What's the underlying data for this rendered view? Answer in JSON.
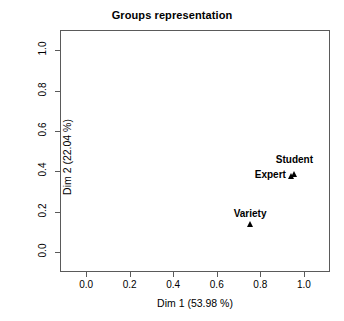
{
  "chart_data": {
    "type": "scatter",
    "title": "Groups representation",
    "xlabel": "Dim 1 (53.98 %)",
    "ylabel": "Dim 2 (22.04 %)",
    "xlim": [
      -0.12,
      1.12
    ],
    "ylim": [
      -0.1,
      1.1
    ],
    "xticks": [
      "0.0",
      "0.2",
      "0.4",
      "0.6",
      "0.8",
      "1.0"
    ],
    "xtick_values": [
      0.0,
      0.2,
      0.4,
      0.6,
      0.8,
      1.0
    ],
    "yticks": [
      "0.0",
      "0.2",
      "0.4",
      "0.6",
      "0.8",
      "1.0"
    ],
    "ytick_values": [
      0.0,
      0.2,
      0.4,
      0.6,
      0.8,
      1.0
    ],
    "grid": false,
    "legend": "none",
    "marker": "triangle",
    "marker_color": "#000000",
    "frame_color": "#5a5a5a",
    "background": "#ffffff",
    "points": [
      {
        "label": "Student",
        "x": 0.955,
        "y": 0.385,
        "label_pos": "above-right"
      },
      {
        "label": "Expert",
        "x": 0.945,
        "y": 0.375,
        "label_pos": "left"
      },
      {
        "label": "Variety",
        "x": 0.753,
        "y": 0.137,
        "label_pos": "above"
      }
    ]
  }
}
